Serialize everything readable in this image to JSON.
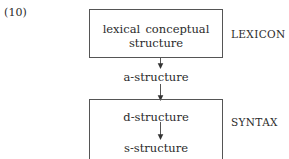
{
  "figure": {
    "example_number": "(10)",
    "colors": {
      "ink": "#2b2b2b",
      "rule": "#555555",
      "background": "#ffffff"
    }
  },
  "modules": [
    {
      "id": "lexicon",
      "side_label": "LEXICON",
      "box_lines": [
        "lexical conceptual structure"
      ]
    },
    {
      "id": "syntax",
      "side_label": "SYNTAX",
      "box_lines": [
        "d-structure",
        "s-structure"
      ]
    }
  ],
  "levels": {
    "lexical_conceptual_structure": "lexical conceptual structure",
    "a_structure": "a-structure",
    "d_structure": "d-structure",
    "s_structure": "s-structure"
  },
  "arrows": [
    {
      "id": "lcs-to-a",
      "from": "lexical conceptual structure",
      "to": "a-structure",
      "direction": "down"
    },
    {
      "id": "a-to-d",
      "from": "a-structure",
      "to": "d-structure",
      "direction": "down"
    },
    {
      "id": "d-to-s",
      "from": "d-structure",
      "to": "s-structure",
      "direction": "down"
    }
  ]
}
